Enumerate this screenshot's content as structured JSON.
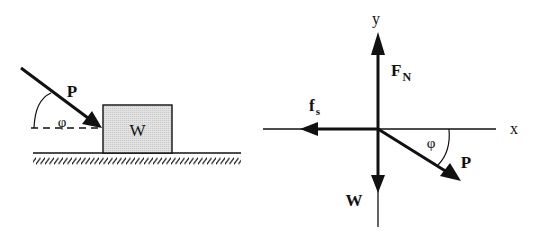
{
  "colors": {
    "ink": "#111111",
    "block_fill": "#d9d9d9",
    "background": "#ffffff"
  },
  "left_figure": {
    "force_label": "P",
    "angle_label": "φ",
    "block_label": "W",
    "ground": "hatched horizontal surface"
  },
  "free_body_diagram": {
    "axes": {
      "x_label": "x",
      "y_label": "y"
    },
    "forces": [
      {
        "name": "normal",
        "label_main": "F",
        "label_sub": "N",
        "direction": "up"
      },
      {
        "name": "friction",
        "label_main": "f",
        "label_sub": "s",
        "direction": "left"
      },
      {
        "name": "weight",
        "label_main": "W",
        "label_sub": "",
        "direction": "down"
      },
      {
        "name": "applied",
        "label_main": "P",
        "label_sub": "",
        "direction": "down-right"
      }
    ],
    "angle_label": "φ"
  }
}
